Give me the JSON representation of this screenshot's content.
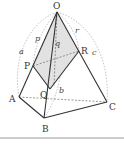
{
  "figure": {
    "colors": {
      "line": "#333333",
      "shade": "#e2e2e2",
      "arc": "#888888",
      "background": "#ffffff"
    },
    "points": {
      "O": {
        "label": "O",
        "x": 57,
        "y": 12
      },
      "A": {
        "label": "A",
        "x": 19,
        "y": 97
      },
      "B": {
        "label": "B",
        "x": 44,
        "y": 118
      },
      "C": {
        "label": "C",
        "x": 107,
        "y": 102
      },
      "P": {
        "label": "P",
        "x": 33,
        "y": 66
      },
      "Q": {
        "label": "Q",
        "x": 50,
        "y": 89
      },
      "R": {
        "label": "R",
        "x": 79,
        "y": 51
      }
    },
    "edge_labels": {
      "a": "a",
      "b": "b",
      "c": "c",
      "p": "p",
      "q": "q",
      "r": "r"
    }
  }
}
